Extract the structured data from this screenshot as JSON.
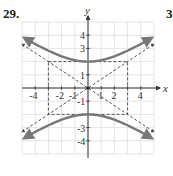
{
  "problem": {
    "number": "29.",
    "next_number_partial": "3"
  },
  "colors": {
    "curve": "#777777",
    "asymptote": "#444444",
    "grid": "#dddddd",
    "axis": "#333333"
  },
  "chart_data": {
    "type": "line",
    "title": "",
    "xlabel": "x",
    "ylabel": "y",
    "xlim": [
      -5,
      5
    ],
    "ylim": [
      -5,
      5
    ],
    "grid": true,
    "x_tick_labels": [
      "-4",
      "-2",
      "-1",
      "1",
      "2",
      "4"
    ],
    "y_tick_labels": [
      "4",
      "3",
      "1",
      "-1",
      "-3",
      "-4"
    ],
    "series": [
      {
        "name": "upper branch",
        "style": "solid",
        "equation": "y = 2*sqrt(1 + x^2/9)",
        "x": [
          -5,
          -4,
          -3,
          -2,
          -1,
          0,
          1,
          2,
          3,
          4,
          5
        ],
        "y": [
          3.89,
          3.33,
          2.83,
          2.4,
          2.11,
          2.0,
          2.11,
          2.4,
          2.83,
          3.33,
          3.89
        ]
      },
      {
        "name": "lower branch",
        "style": "solid",
        "equation": "y = -2*sqrt(1 + x^2/9)",
        "x": [
          -5,
          -4,
          -3,
          -2,
          -1,
          0,
          1,
          2,
          3,
          4,
          5
        ],
        "y": [
          -3.89,
          -3.33,
          -2.83,
          -2.4,
          -2.11,
          -2.0,
          -2.11,
          -2.4,
          -2.83,
          -3.33,
          -3.89
        ]
      },
      {
        "name": "asymptote y = 2x/3",
        "style": "dashed",
        "x": [
          -5,
          5
        ],
        "y": [
          -3.33,
          3.33
        ]
      },
      {
        "name": "asymptote y = -2x/3",
        "style": "dashed",
        "x": [
          -5,
          5
        ],
        "y": [
          3.33,
          -3.33
        ]
      },
      {
        "name": "central rectangle",
        "style": "dashed",
        "x": [
          -3,
          3,
          3,
          -3,
          -3
        ],
        "y": [
          2,
          2,
          -2,
          -2,
          2
        ]
      }
    ],
    "vertices": [
      [
        0,
        2
      ],
      [
        0,
        -2
      ]
    ]
  }
}
